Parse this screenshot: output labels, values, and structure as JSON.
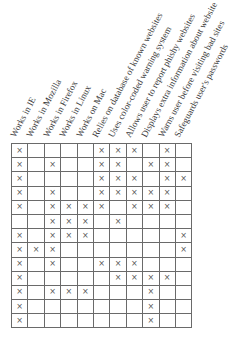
{
  "columns": [
    "Works in IE",
    "Works in Mozilla",
    "Works in Firefox",
    "Works in Linux",
    "Works on Mac",
    "Relies on database of known websites",
    "Uses color-coded warning system",
    "Allows user to report phishy websites",
    "Displays extra information about website",
    "Warns user before visiting bad sites",
    "Safeguards user's passwords"
  ],
  "mark_symbol": "×",
  "rows": [
    [
      1,
      0,
      0,
      0,
      0,
      1,
      1,
      1,
      0,
      1,
      0
    ],
    [
      1,
      0,
      1,
      0,
      0,
      1,
      1,
      0,
      1,
      1,
      0
    ],
    [
      1,
      0,
      0,
      0,
      0,
      1,
      1,
      1,
      0,
      1,
      1
    ],
    [
      1,
      0,
      1,
      0,
      0,
      1,
      1,
      1,
      1,
      1,
      0
    ],
    [
      1,
      0,
      1,
      1,
      1,
      1,
      0,
      1,
      1,
      1,
      0
    ],
    [
      0,
      0,
      1,
      1,
      1,
      0,
      1,
      0,
      0,
      0,
      0
    ],
    [
      1,
      0,
      1,
      1,
      1,
      0,
      0,
      0,
      0,
      0,
      1
    ],
    [
      1,
      1,
      1,
      0,
      0,
      0,
      0,
      0,
      0,
      0,
      1
    ],
    [
      1,
      0,
      1,
      0,
      0,
      1,
      1,
      1,
      0,
      0,
      0
    ],
    [
      1,
      0,
      0,
      0,
      0,
      0,
      1,
      1,
      1,
      1,
      0
    ],
    [
      1,
      0,
      1,
      1,
      1,
      0,
      0,
      0,
      1,
      0,
      0
    ],
    [
      1,
      0,
      0,
      0,
      0,
      0,
      0,
      0,
      1,
      0,
      0
    ],
    [
      1,
      0,
      0,
      0,
      0,
      0,
      0,
      0,
      1,
      0,
      0
    ]
  ]
}
